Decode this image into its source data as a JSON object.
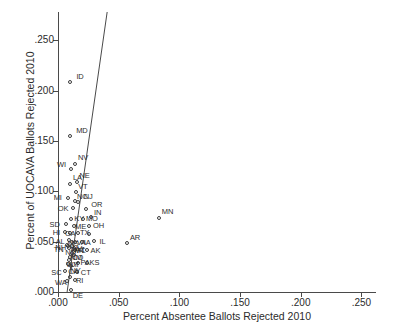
{
  "chart_data": {
    "type": "scatter",
    "title": "",
    "xlabel": "Percent Absentee Ballots Rejected 2010",
    "ylabel": "Percent of UOCAVA Ballots Rejected 2010",
    "xlim": [
      0.0,
      0.262
    ],
    "ylim": [
      0.0,
      0.278
    ],
    "xticks": [
      0.0,
      0.05,
      0.1,
      0.15,
      0.2,
      0.25
    ],
    "yticks": [
      0.0,
      0.05,
      0.1,
      0.15,
      0.2,
      0.25
    ],
    "xticklabels": [
      ".000",
      ".050",
      ".100",
      ".150",
      ".200",
      ".250"
    ],
    "yticklabels": [
      ".000",
      ".050",
      ".100",
      ".150",
      ".200",
      ".250"
    ],
    "grid": false,
    "legend": null,
    "marker": "open-circle",
    "reference_line": {
      "name": "45-degree-reference-line",
      "x0": 0.0075,
      "y0": 0.0,
      "x1": 0.0405,
      "y1": 0.278
    },
    "points": [
      {
        "label": "ID",
        "x": 0.0102,
        "y": 0.2085,
        "lx": 6,
        "ly": -9
      },
      {
        "label": "MD",
        "x": 0.01,
        "y": 0.155,
        "lx": 6,
        "ly": -9
      },
      {
        "label": "NV",
        "x": 0.014,
        "y": 0.127,
        "lx": 3,
        "ly": -10
      },
      {
        "label": "WI",
        "x": 0.0108,
        "y": 0.122,
        "lx": -14,
        "ly": -8
      },
      {
        "label": "LA",
        "x": 0.0098,
        "y": 0.107,
        "lx": 3,
        "ly": -10
      },
      {
        "label": "NE",
        "x": 0.016,
        "y": 0.109,
        "lx": 2,
        "ly": -10
      },
      {
        "label": "VT",
        "x": 0.015,
        "y": 0.099,
        "lx": 2,
        "ly": -9
      },
      {
        "label": "MI",
        "x": 0.008,
        "y": 0.0935,
        "lx": -14,
        "ly": -4
      },
      {
        "label": "NC",
        "x": 0.014,
        "y": 0.09,
        "lx": 2,
        "ly": -8
      },
      {
        "label": "NJ",
        "x": 0.0162,
        "y": 0.0892,
        "lx": 6,
        "ly": -9
      },
      {
        "label": "OK",
        "x": 0.0122,
        "y": 0.083,
        "lx": -15,
        "ly": -3
      },
      {
        "label": "OR",
        "x": 0.0232,
        "y": 0.0822,
        "lx": 5,
        "ly": -8
      },
      {
        "label": "KY",
        "x": 0.011,
        "y": 0.0728,
        "lx": 3,
        "ly": -4
      },
      {
        "label": "MO",
        "x": 0.0205,
        "y": 0.072,
        "lx": 3,
        "ly": -4
      },
      {
        "label": "IN",
        "x": 0.0272,
        "y": 0.0742,
        "lx": 3,
        "ly": -8
      },
      {
        "label": "MN",
        "x": 0.083,
        "y": 0.073,
        "lx": 3,
        "ly": -10
      },
      {
        "label": "SD",
        "x": 0.0062,
        "y": 0.0672,
        "lx": -16,
        "ly": -3
      },
      {
        "label": "ME",
        "x": 0.0132,
        "y": 0.066,
        "lx": 1,
        "ly": -3
      },
      {
        "label": "OH",
        "x": 0.0255,
        "y": 0.0652,
        "lx": 4,
        "ly": -4
      },
      {
        "label": "HI",
        "x": 0.0055,
        "y": 0.06,
        "lx": -12,
        "ly": -3
      },
      {
        "label": "GA",
        "x": 0.0098,
        "y": 0.059,
        "lx": -5,
        "ly": -3
      },
      {
        "label": "TX",
        "x": 0.0165,
        "y": 0.0588,
        "lx": 2,
        "ly": -4
      },
      {
        "label": "NJ2",
        "x": 0.0252,
        "y": 0.0578,
        "lx": 4,
        "ly": -7
      },
      {
        "label": "AR",
        "x": 0.0568,
        "y": 0.0482,
        "lx": 3,
        "ly": -9
      },
      {
        "label": "IL",
        "x": 0.03,
        "y": 0.0508,
        "lx": 5,
        "ly": -3
      },
      {
        "label": "AL",
        "x": 0.0088,
        "y": 0.0512,
        "lx": -13,
        "ly": -2
      },
      {
        "label": "MS",
        "x": 0.0112,
        "y": 0.05,
        "lx": -4,
        "ly": -2
      },
      {
        "label": "VA",
        "x": 0.0138,
        "y": 0.0498,
        "lx": 2,
        "ly": -3
      },
      {
        "label": "IA",
        "x": 0.0195,
        "y": 0.0495,
        "lx": 2,
        "ly": -3
      },
      {
        "label": "FL",
        "x": 0.014,
        "y": 0.042,
        "lx": 2,
        "ly": -3
      },
      {
        "label": "AK",
        "x": 0.0235,
        "y": 0.0415,
        "lx": 4,
        "ly": -3
      },
      {
        "label": "CO",
        "x": 0.01,
        "y": 0.035,
        "lx": 2,
        "ly": -3
      },
      {
        "label": "UT",
        "x": 0.0082,
        "y": 0.0282,
        "lx": 2,
        "ly": -3
      },
      {
        "label": "PA",
        "x": 0.0168,
        "y": 0.0288,
        "lx": 2,
        "ly": -4
      },
      {
        "label": "KS",
        "x": 0.0235,
        "y": 0.0288,
        "lx": 3,
        "ly": -4
      },
      {
        "label": "SC",
        "x": 0.006,
        "y": 0.0205,
        "lx": -14,
        "ly": -2
      },
      {
        "label": "CT",
        "x": 0.0155,
        "y": 0.0198,
        "lx": 4,
        "ly": -3
      },
      {
        "label": "WA",
        "x": 0.0075,
        "y": 0.0112,
        "lx": -12,
        "ly": -2
      },
      {
        "label": "RI",
        "x": 0.014,
        "y": 0.012,
        "lx": 1,
        "ly": -3
      },
      {
        "label": "DE",
        "x": 0.0105,
        "y": 0.0018,
        "lx": 2,
        "ly": 2
      },
      {
        "label": "NH",
        "x": 0.0085,
        "y": 0.0455,
        "lx": -13,
        "ly": -2
      },
      {
        "label": "TN",
        "x": 0.0072,
        "y": 0.0462,
        "lx": -13,
        "ly": 1
      },
      {
        "label": "WV",
        "x": 0.0118,
        "y": 0.0455,
        "lx": -2,
        "ly": -1
      },
      {
        "label": "MT",
        "x": 0.0128,
        "y": 0.044,
        "lx": 1,
        "ly": -1
      },
      {
        "label": "ND",
        "x": 0.0092,
        "y": 0.0432,
        "lx": -4,
        "ly": 1
      },
      {
        "label": "NM",
        "x": 0.0118,
        "y": 0.039,
        "lx": -2,
        "ly": 1
      },
      {
        "label": "AZ",
        "x": 0.0132,
        "y": 0.0368,
        "lx": 1,
        "ly": 0
      },
      {
        "label": "WY",
        "x": 0.0092,
        "y": 0.0322,
        "lx": -3,
        "ly": 1
      },
      {
        "label": "NY",
        "x": 0.011,
        "y": 0.0258,
        "lx": -1,
        "ly": 1
      },
      {
        "label": "CA",
        "x": 0.01,
        "y": 0.0148,
        "lx": -2,
        "ly": 0
      }
    ]
  }
}
